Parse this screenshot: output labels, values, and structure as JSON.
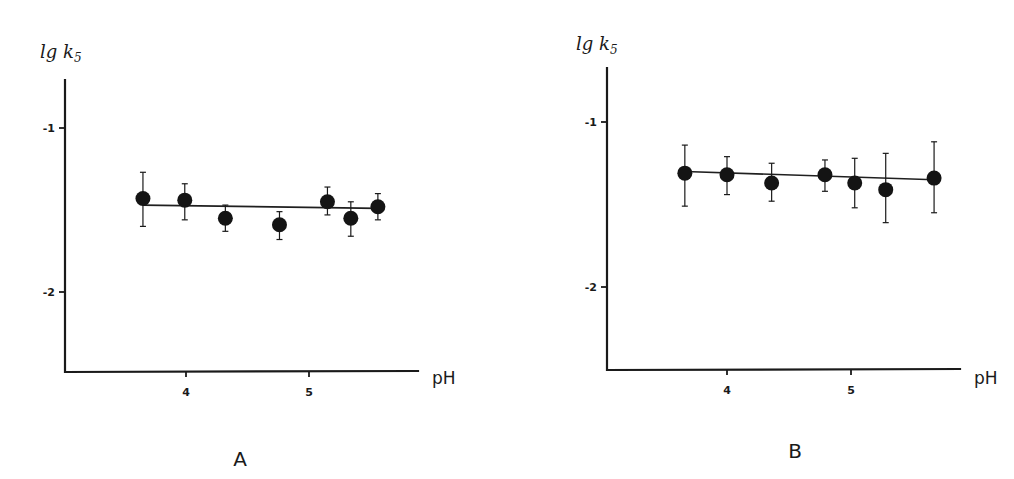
{
  "chart_data": [
    {
      "type": "scatter",
      "panel_label": "A",
      "title": "",
      "xlabel": "pH",
      "ylabel": "lg k",
      "ylabel_subscript": "5",
      "xticks": [
        4,
        5
      ],
      "yticks": [
        -1,
        -2
      ],
      "ytick_labels": [
        "-1",
        "-2"
      ],
      "xtick_labels": [
        "4",
        "5"
      ],
      "xlim": [
        3.05,
        5.9
      ],
      "ylim": [
        -2.5,
        -0.7
      ],
      "grid": false,
      "series": [
        {
          "name": "measured",
          "marker": "filled-circle",
          "points": [
            {
              "x": 3.65,
              "y": -1.43,
              "err_low": -1.6,
              "err_high": -1.27
            },
            {
              "x": 3.99,
              "y": -1.44,
              "err_low": -1.56,
              "err_high": -1.34
            },
            {
              "x": 4.32,
              "y": -1.55,
              "err_low": -1.63,
              "err_high": -1.47
            },
            {
              "x": 4.76,
              "y": -1.59,
              "err_low": -1.68,
              "err_high": -1.51
            },
            {
              "x": 5.15,
              "y": -1.45,
              "err_low": -1.53,
              "err_high": -1.36
            },
            {
              "x": 5.34,
              "y": -1.55,
              "err_low": -1.66,
              "err_high": -1.45
            },
            {
              "x": 5.56,
              "y": -1.48,
              "err_low": -1.56,
              "err_high": -1.4
            }
          ]
        },
        {
          "name": "fit",
          "type": "line",
          "points": [
            {
              "x": 3.65,
              "y": -1.47
            },
            {
              "x": 5.56,
              "y": -1.49
            }
          ]
        }
      ]
    },
    {
      "type": "scatter",
      "panel_label": "B",
      "title": "",
      "xlabel": "pH",
      "ylabel": "lg k",
      "ylabel_subscript": "5",
      "xticks": [
        4,
        5
      ],
      "yticks": [
        -1,
        -2
      ],
      "ytick_labels": [
        "-1",
        "-2"
      ],
      "xtick_labels": [
        "4",
        "5"
      ],
      "xlim": [
        3.03,
        5.9
      ],
      "ylim": [
        -2.5,
        -0.67
      ],
      "grid": false,
      "series": [
        {
          "name": "measured",
          "marker": "filled-circle",
          "points": [
            {
              "x": 3.66,
              "y": -1.31,
              "err_low": -1.51,
              "err_high": -1.14
            },
            {
              "x": 4.0,
              "y": -1.32,
              "err_low": -1.44,
              "err_high": -1.21
            },
            {
              "x": 4.36,
              "y": -1.37,
              "err_low": -1.48,
              "err_high": -1.25
            },
            {
              "x": 4.79,
              "y": -1.32,
              "err_low": -1.42,
              "err_high": -1.23
            },
            {
              "x": 5.03,
              "y": -1.37,
              "err_low": -1.52,
              "err_high": -1.22
            },
            {
              "x": 5.28,
              "y": -1.41,
              "err_low": -1.61,
              "err_high": -1.19
            },
            {
              "x": 5.67,
              "y": -1.34,
              "err_low": -1.55,
              "err_high": -1.12
            }
          ]
        },
        {
          "name": "fit",
          "type": "line",
          "points": [
            {
              "x": 3.66,
              "y": -1.3
            },
            {
              "x": 5.67,
              "y": -1.35
            }
          ]
        }
      ]
    }
  ],
  "layout": [
    {
      "origin_px": {
        "x": 65,
        "y": 372
      },
      "x_ref": {
        "v1": 4,
        "p1": 186,
        "v2": 5,
        "p2": 309
      },
      "y_ref": {
        "v1": -1,
        "p1": 128,
        "v2": -2,
        "p2": 292
      },
      "y_axis_top": 80,
      "x_axis_right": 418,
      "ylabel_pos": {
        "x": 40,
        "y": 58
      },
      "xlabel_pos": {
        "x": 432,
        "y": 384
      },
      "panel_pos": {
        "x": 240,
        "y": 466
      }
    },
    {
      "origin_px": {
        "x": 607,
        "y": 370
      },
      "x_ref": {
        "v1": 4,
        "p1": 727,
        "v2": 5,
        "p2": 851
      },
      "y_ref": {
        "v1": -1,
        "p1": 122,
        "v2": -2,
        "p2": 287
      },
      "y_axis_top": 68,
      "x_axis_right": 960,
      "ylabel_pos": {
        "x": 576,
        "y": 50
      },
      "xlabel_pos": {
        "x": 974,
        "y": 384
      },
      "panel_pos": {
        "x": 795,
        "y": 458
      }
    }
  ]
}
